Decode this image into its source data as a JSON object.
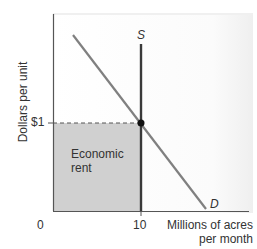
{
  "diagram": {
    "type": "supply-demand",
    "y_axis_label": "Dollars per unit",
    "x_axis_label_line1": "Millions of acres",
    "x_axis_label_line2": "per month",
    "origin_label": "0",
    "y_tick_label": "$1",
    "x_tick_label": "10",
    "supply_label": "S",
    "demand_label": "D",
    "shaded_area_label_line1": "Economic",
    "shaded_area_label_line2": "rent",
    "equilibrium": {
      "quantity": 10,
      "price": 1
    },
    "colors": {
      "shaded_area": "#d0d0d0",
      "supply_line": "#3a3a3a",
      "demand_line": "#808080",
      "axis": "#555555",
      "equilibrium_point": "#111111"
    }
  }
}
